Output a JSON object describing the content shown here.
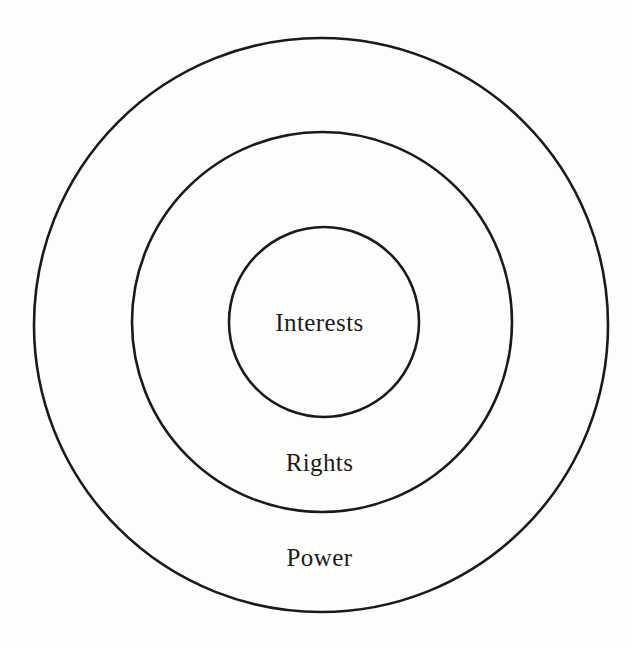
{
  "diagram": {
    "type": "concentric-circles",
    "background_color": "#fdfdfc",
    "stroke_color": "#1a1a1a",
    "text_color": "#1c1c1c",
    "rings": [
      {
        "id": "power",
        "label": "Power",
        "order": 1,
        "position": "outer",
        "center_x": 321,
        "center_y": 325,
        "radius": 287,
        "stroke_width": 2.6,
        "label_x": 327,
        "label_y": 557
      },
      {
        "id": "rights",
        "label": "Rights",
        "order": 2,
        "position": "middle",
        "center_x": 322,
        "center_y": 322,
        "radius": 190,
        "stroke_width": 2.6,
        "label_x": 327,
        "label_y": 462
      },
      {
        "id": "interests",
        "label": "Interests",
        "order": 3,
        "position": "inner",
        "center_x": 324,
        "center_y": 322,
        "radius": 95,
        "stroke_width": 2.6,
        "label_x": 327,
        "label_y": 322
      }
    ]
  }
}
